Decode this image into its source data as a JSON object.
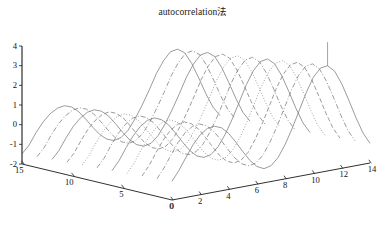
{
  "figure": {
    "title": "autocorrelation法",
    "caption": "",
    "background_color": "#ffffff",
    "line_color": "#7a7a7a",
    "axis_color": "#1a1a1a",
    "projection": "3d-waterfall"
  },
  "chart_data": {
    "type": "line",
    "title": "autocorrelation法",
    "xlabel": "",
    "ylabel": "",
    "zlabel": "",
    "grid": false,
    "legend": "none",
    "xlim": [
      0,
      14
    ],
    "ylim": [
      0,
      15
    ],
    "zlim": [
      -2,
      4
    ],
    "x_ticks": [
      0,
      2,
      4,
      6,
      8,
      10,
      12,
      14
    ],
    "y_ticks": [
      0,
      5,
      10,
      15
    ],
    "z_ticks": [
      -2,
      -1,
      0,
      1,
      2,
      3,
      4
    ],
    "x_tick_labels": [
      "0",
      "2",
      "4",
      "6",
      "8",
      "10",
      "12",
      "14"
    ],
    "y_tick_labels": [
      "0",
      "5",
      "10",
      "15"
    ],
    "z_tick_labels": [
      "-2",
      "-1",
      "0",
      "1",
      "2",
      "3",
      "4"
    ],
    "x": [
      0,
      0.5,
      1,
      1.5,
      2,
      2.5,
      3,
      3.5,
      4,
      4.5,
      5,
      5.5,
      6,
      6.5,
      7,
      7.5,
      8,
      8.5,
      9,
      9.5,
      10,
      10.5,
      11,
      11.5,
      12,
      12.5,
      13,
      13.5,
      14
    ],
    "series": [
      {
        "name": "trace y=0",
        "y": 0,
        "style": "solid",
        "values": [
          -1.05,
          -0.55,
          0.05,
          0.62,
          1.05,
          1.3,
          1.35,
          1.2,
          0.85,
          0.35,
          -0.2,
          -0.72,
          -1.1,
          -1.28,
          -1.2,
          -0.85,
          -0.25,
          0.5,
          1.35,
          2.2,
          2.9,
          3.3,
          3.35,
          3.0,
          2.3,
          1.4,
          0.45,
          -0.4,
          -1.0
        ]
      },
      {
        "name": "trace y=1.5",
        "y": 1.5,
        "style": "dashdot",
        "values": [
          -1.1,
          -0.62,
          -0.02,
          0.55,
          0.98,
          1.22,
          1.28,
          1.12,
          0.78,
          0.28,
          -0.27,
          -0.78,
          -1.15,
          -1.32,
          -1.24,
          -0.9,
          -0.3,
          0.44,
          1.28,
          2.12,
          2.8,
          3.2,
          3.26,
          2.92,
          2.22,
          1.32,
          0.38,
          -0.46,
          -1.05
        ]
      },
      {
        "name": "trace y=3",
        "y": 3,
        "style": "dashed",
        "values": [
          -1.15,
          -0.68,
          -0.08,
          0.48,
          0.9,
          1.14,
          1.2,
          1.04,
          0.7,
          0.2,
          -0.34,
          -0.85,
          -1.2,
          -1.36,
          -1.28,
          -0.95,
          -0.36,
          0.37,
          1.2,
          2.04,
          2.7,
          3.1,
          3.16,
          2.83,
          2.14,
          1.25,
          0.31,
          -0.52,
          -1.1
        ]
      },
      {
        "name": "trace y=4.5",
        "y": 4.5,
        "style": "dotted",
        "values": [
          -1.2,
          -0.74,
          -0.14,
          0.4,
          0.82,
          1.06,
          1.12,
          0.96,
          0.62,
          0.13,
          -0.41,
          -0.9,
          -1.25,
          -1.4,
          -1.32,
          -0.99,
          -0.42,
          0.3,
          1.12,
          1.95,
          2.6,
          3.0,
          3.06,
          2.74,
          2.06,
          1.18,
          0.25,
          -0.57,
          -1.14
        ]
      },
      {
        "name": "trace y=6",
        "y": 6,
        "style": "solid",
        "values": [
          -1.24,
          -0.8,
          -0.2,
          0.33,
          0.74,
          0.98,
          1.04,
          0.88,
          0.55,
          0.06,
          -0.47,
          -0.96,
          -1.3,
          -1.44,
          -1.36,
          -1.03,
          -0.47,
          0.24,
          1.04,
          1.86,
          2.5,
          2.9,
          2.96,
          2.65,
          1.98,
          1.11,
          0.19,
          -0.62,
          -1.18
        ]
      },
      {
        "name": "trace y=7.5",
        "y": 7.5,
        "style": "dashdot",
        "values": [
          -1.28,
          -0.86,
          -0.26,
          0.26,
          0.66,
          0.9,
          0.96,
          0.8,
          0.48,
          -0.01,
          -0.53,
          -1.01,
          -1.34,
          -1.48,
          -1.4,
          -1.08,
          -0.52,
          0.18,
          0.96,
          1.77,
          2.4,
          2.8,
          2.86,
          2.56,
          1.9,
          1.04,
          0.13,
          -0.67,
          -1.22
        ]
      },
      {
        "name": "trace y=9",
        "y": 9,
        "style": "dotted",
        "values": [
          -1.32,
          -0.91,
          -0.32,
          0.2,
          0.58,
          0.82,
          0.88,
          0.73,
          0.41,
          -0.08,
          -0.59,
          -1.06,
          -1.38,
          -1.52,
          -1.44,
          -1.12,
          -0.57,
          0.11,
          0.88,
          1.68,
          2.3,
          2.7,
          2.76,
          2.47,
          1.82,
          0.97,
          0.07,
          -0.72,
          -1.26
        ]
      },
      {
        "name": "trace y=10.5",
        "y": 10.5,
        "style": "dashed",
        "values": [
          -1.36,
          -0.96,
          -0.38,
          0.13,
          0.5,
          0.74,
          0.8,
          0.65,
          0.34,
          -0.14,
          -0.65,
          -1.11,
          -1.42,
          -1.56,
          -1.48,
          -1.16,
          -0.62,
          0.05,
          0.8,
          1.59,
          2.2,
          2.6,
          2.66,
          2.38,
          1.74,
          0.9,
          0.01,
          -0.77,
          -1.3
        ]
      },
      {
        "name": "trace y=12",
        "y": 12,
        "style": "solid",
        "values": [
          -1.4,
          -1.01,
          -0.43,
          0.07,
          0.43,
          0.66,
          0.72,
          0.58,
          0.27,
          -0.2,
          -0.7,
          -1.15,
          -1.46,
          -1.6,
          -1.52,
          -1.2,
          -0.67,
          -0.01,
          0.72,
          1.5,
          2.1,
          2.5,
          2.56,
          2.29,
          1.66,
          0.83,
          -0.05,
          -0.82,
          -1.34
        ]
      },
      {
        "name": "trace y=13.5",
        "y": 13.5,
        "style": "dashdot",
        "values": [
          -1.44,
          -1.06,
          -0.48,
          0.0,
          0.36,
          0.58,
          0.64,
          0.5,
          0.2,
          -0.26,
          -0.75,
          -1.2,
          -1.5,
          -1.64,
          -1.56,
          -1.25,
          -0.72,
          -0.08,
          0.64,
          1.41,
          2.0,
          2.4,
          2.46,
          2.2,
          1.58,
          0.76,
          -0.11,
          -0.87,
          -1.38
        ]
      },
      {
        "name": "trace y=15",
        "y": 15,
        "style": "solid",
        "values": [
          -1.48,
          -1.11,
          -0.53,
          -0.06,
          0.29,
          0.5,
          0.56,
          0.43,
          0.13,
          -0.32,
          -0.8,
          -1.24,
          -1.54,
          -1.68,
          -1.6,
          -1.29,
          -0.77,
          -0.14,
          0.56,
          1.32,
          1.9,
          2.3,
          2.36,
          2.11,
          1.5,
          0.69,
          -0.17,
          -0.92,
          -1.42
        ]
      }
    ]
  },
  "axes": {
    "z_labels": [
      "4",
      "3",
      "2",
      "1",
      "0",
      "-1",
      "-2"
    ],
    "y_labels": [
      "15",
      "10",
      "5",
      "0"
    ],
    "x_labels": [
      "0",
      "2",
      "4",
      "6",
      "8",
      "10",
      "12",
      "14"
    ]
  }
}
